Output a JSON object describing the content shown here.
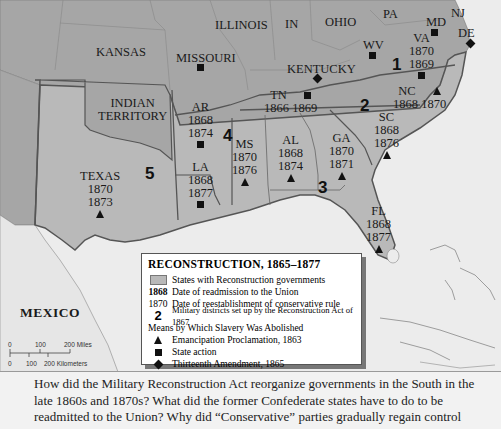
{
  "map": {
    "title": "RECONSTRUCTION, 1865–1877",
    "colors": {
      "reconstruction_state": "#b9b9b9",
      "other_state": "#a6a6a6",
      "water": "#ececec",
      "border_heavy": "#555555"
    },
    "labels": {
      "kansas": "KANSAS",
      "missouri": "MISSOURI",
      "illinois": "ILLINOIS",
      "indiana": "IN",
      "ohio": "OHIO",
      "pennsylvania": "PA",
      "new_jersey": "NJ",
      "maryland": "MD",
      "delaware": "DE",
      "west_virginia": "WV",
      "kentucky": "KENTUCKY",
      "indian_territory_1": "INDIAN",
      "indian_territory_2": "TERRITORY",
      "mexico": "MEXICO"
    },
    "states": {
      "virginia": {
        "abbr": "VA",
        "readmitted": "1870",
        "conservative": "1869",
        "symbol": "square"
      },
      "north_carolina": {
        "abbr": "NC",
        "readmitted": "1868",
        "conservative": "1870",
        "symbol": "triangle"
      },
      "tennessee": {
        "abbr": "TN",
        "readmitted": "1866",
        "conservative": "1869",
        "symbol": "square"
      },
      "south_carolina": {
        "abbr": "SC",
        "readmitted": "1868",
        "conservative": "1876",
        "symbol": "triangle"
      },
      "georgia": {
        "abbr": "GA",
        "readmitted": "1870",
        "conservative": "1871",
        "symbol": "triangle"
      },
      "alabama": {
        "abbr": "AL",
        "readmitted": "1868",
        "conservative": "1874",
        "symbol": "triangle"
      },
      "mississippi": {
        "abbr": "MS",
        "readmitted": "1870",
        "conservative": "1876",
        "symbol": "triangle"
      },
      "arkansas": {
        "abbr": "AR",
        "readmitted": "1868",
        "conservative": "1874",
        "symbol": "square"
      },
      "louisiana": {
        "abbr": "LA",
        "readmitted": "1868",
        "conservative": "1877",
        "symbol": "square"
      },
      "florida": {
        "abbr": "FL",
        "readmitted": "1868",
        "conservative": "1877",
        "symbol": "triangle"
      },
      "texas": {
        "abbr": "TEXAS",
        "readmitted": "1870",
        "conservative": "1873",
        "symbol": "triangle"
      }
    },
    "military_districts": [
      "1",
      "2",
      "3",
      "4",
      "5"
    ]
  },
  "legend": {
    "title": "RECONSTRUCTION, 1865–1877",
    "items": [
      {
        "key": "",
        "text": "States with Reconstruction governments"
      },
      {
        "key": "1868",
        "text": "Date of readmission to the Union"
      },
      {
        "key": "1870",
        "text": "Date of reestablishment of conservative rule"
      },
      {
        "key": "2",
        "text": "Military districts set up by the Reconstruction Act of 1867"
      }
    ],
    "means_heading": "Means by Which Slavery Was Abolished",
    "means": [
      {
        "symbol": "triangle",
        "text": "Emancipation Proclamation, 1863"
      },
      {
        "symbol": "square",
        "text": "State action"
      },
      {
        "symbol": "diamond",
        "text": "Thirteenth Amendment, 1865"
      }
    ]
  },
  "scale": {
    "miles": [
      "0",
      "100",
      "200 Miles"
    ],
    "km": [
      "0",
      "100",
      "200 Kilometers"
    ]
  },
  "caption": {
    "text": "How did the Military Reconstruction Act reorganize governments in the South in the late 1860s and 1870s? What did the former Confederate states have to do to be readmitted to the Union? Why did “Conservative” parties gradually regain control"
  }
}
